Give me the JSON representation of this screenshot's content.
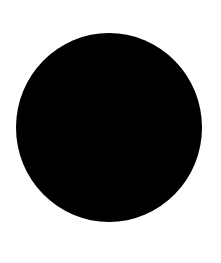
{
  "canvas": {
    "background": "#ffffff"
  },
  "shape": {
    "type": "circle",
    "fill": "#000000",
    "label": ""
  }
}
